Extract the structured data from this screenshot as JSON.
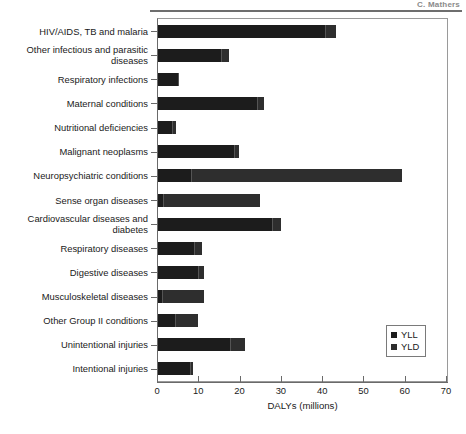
{
  "page_header": {
    "text": "C. Mathers"
  },
  "chart_data": {
    "type": "bar",
    "orientation": "horizontal",
    "stacked": true,
    "title": "",
    "subtitle": "",
    "xlabel": "DALYs (millions)",
    "ylabel": "",
    "xlim": [
      0,
      70
    ],
    "xticks": [
      0,
      10,
      20,
      30,
      40,
      50,
      60,
      70
    ],
    "xticklabels": [
      "0",
      "10",
      "20",
      "30",
      "40",
      "50",
      "60",
      "70"
    ],
    "grid": false,
    "legend_position": "lower-right",
    "categories": [
      "HIV/AIDS, TB and malaria",
      "Other infectious and parasitic diseases",
      "Respiratory infections",
      "Maternal conditions",
      "Nutritional deficiencies",
      "Malignant neoplasms",
      "Neuropsychiatric conditions",
      "Sense organ diseases",
      "Cardiovascular diseases and diabetes",
      "Respiratory diseases",
      "Digestive diseases",
      "Musculoskeletal diseases",
      "Other Group II conditions",
      "Unintentional injuries",
      "Intentional injuries"
    ],
    "series": [
      {
        "name": "YLL",
        "values": [
          40.5,
          15.2,
          4.8,
          24.0,
          3.4,
          18.5,
          8.0,
          1.2,
          27.5,
          8.6,
          9.8,
          1.0,
          4.2,
          17.5,
          7.8
        ]
      },
      {
        "name": "YLD",
        "values": [
          2.5,
          2.0,
          0.4,
          1.6,
          1.0,
          1.0,
          51.0,
          23.5,
          2.3,
          2.0,
          1.4,
          10.2,
          5.6,
          3.5,
          0.7
        ]
      }
    ],
    "totals": [
      43.0,
      17.2,
      5.2,
      25.6,
      4.4,
      19.5,
      59.0,
      24.7,
      29.8,
      10.6,
      11.2,
      11.2,
      9.8,
      21.0,
      8.5
    ],
    "legend": [
      {
        "label": "YLL",
        "color": "#1c1c1c"
      },
      {
        "label": "YLD",
        "color": "#2e2e2e"
      }
    ]
  }
}
